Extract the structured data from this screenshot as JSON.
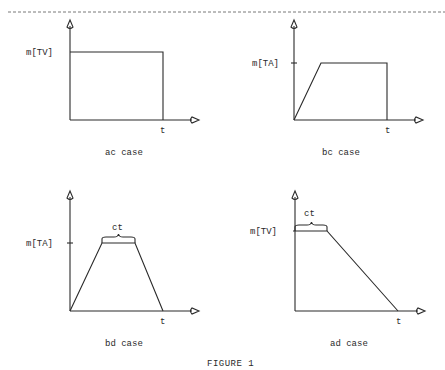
{
  "figure": {
    "caption": "FIGURE 1"
  },
  "panels": [
    {
      "id": "ac",
      "title": "ac case",
      "y_label": "m[TV]",
      "x_label": "t",
      "brace_label": null
    },
    {
      "id": "bc",
      "title": "bc case",
      "y_label": "m[TA]",
      "x_label": "t",
      "brace_label": null
    },
    {
      "id": "bd",
      "title": "bd case",
      "y_label": "m[TA]",
      "x_label": "t",
      "brace_label": "ct"
    },
    {
      "id": "ad",
      "title": "ad case",
      "y_label": "m[TV]",
      "x_label": "t",
      "brace_label": "ct"
    }
  ]
}
